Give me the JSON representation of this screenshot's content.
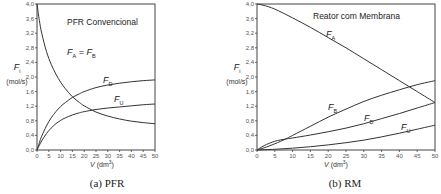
{
  "chart_data": [
    {
      "type": "line",
      "title": "PFR Convencional",
      "caption": "(a) PFR",
      "xlabel": "V (dm³)",
      "xlabel_main": "V",
      "xlabel_unit": "(dm",
      "xlabel_sup": "3",
      "xlabel_close": ")",
      "ylabel": "F_i (mol/s)",
      "ylabel_main": "F",
      "ylabel_sub": "i",
      "ylabel_unit": "(mol/s)",
      "xlim": [
        0,
        50
      ],
      "ylim": [
        0,
        4.0
      ],
      "xticks": [
        "0",
        "5",
        "10",
        "15",
        "20",
        "25",
        "30",
        "35",
        "40",
        "45",
        "50"
      ],
      "yticks": [
        "0,0",
        "0,4",
        "0,8",
        "1,2",
        "1,6",
        "2,0",
        "2,4",
        "2,8",
        "3,2",
        "3,6",
        "4,0"
      ],
      "grid": false,
      "series": [
        {
          "name": "FA = FB",
          "label_main": "F",
          "label_sub": "A",
          "label_eq": " = F",
          "label_sub2": "B",
          "x": [
            0,
            1,
            2,
            4,
            6,
            8,
            10,
            12,
            15,
            18,
            20,
            25,
            30,
            35,
            40,
            45,
            50
          ],
          "y": [
            4.0,
            3.55,
            3.2,
            2.7,
            2.35,
            2.08,
            1.86,
            1.68,
            1.46,
            1.3,
            1.21,
            1.04,
            0.93,
            0.85,
            0.79,
            0.75,
            0.72
          ]
        },
        {
          "name": "FD",
          "label_main": "F",
          "label_sub": "D",
          "x": [
            0,
            1,
            2,
            4,
            6,
            8,
            10,
            12,
            15,
            18,
            20,
            25,
            30,
            35,
            40,
            45,
            50
          ],
          "y": [
            0.0,
            0.2,
            0.38,
            0.66,
            0.88,
            1.05,
            1.19,
            1.3,
            1.44,
            1.54,
            1.6,
            1.71,
            1.78,
            1.83,
            1.87,
            1.9,
            1.92
          ]
        },
        {
          "name": "FU",
          "label_main": "F",
          "label_sub": "U",
          "x": [
            0,
            1,
            2,
            4,
            6,
            8,
            10,
            12,
            15,
            18,
            20,
            25,
            30,
            35,
            40,
            45,
            50
          ],
          "y": [
            0.0,
            0.13,
            0.25,
            0.45,
            0.6,
            0.72,
            0.81,
            0.88,
            0.96,
            1.02,
            1.05,
            1.11,
            1.15,
            1.18,
            1.21,
            1.24,
            1.26
          ]
        }
      ]
    },
    {
      "type": "line",
      "title": "Reator com Membrana",
      "caption": "(b) RM",
      "xlabel": "V (dm³)",
      "xlabel_main": "V",
      "xlabel_unit": "(dm",
      "xlabel_sup": "3",
      "xlabel_close": ")",
      "ylabel": "F_i (mol/s)",
      "ylabel_main": "F",
      "ylabel_sub": "i",
      "ylabel_unit": "(mol/s)",
      "xlim": [
        0,
        50
      ],
      "ylim": [
        0,
        4.0
      ],
      "xticks": [
        "0",
        "5",
        "10",
        "15",
        "20",
        "25",
        "30",
        "35",
        "40",
        "45",
        "50"
      ],
      "yticks": [
        "0,0",
        "0,4",
        "0,8",
        "1,2",
        "1,6",
        "2,0",
        "2,4",
        "2,8",
        "3,2",
        "3,6",
        "4,0"
      ],
      "grid": false,
      "series": [
        {
          "name": "FA",
          "label_main": "F",
          "label_sub": "A",
          "x": [
            0,
            2,
            5,
            10,
            15,
            20,
            25,
            30,
            35,
            40,
            45,
            50
          ],
          "y": [
            4.0,
            3.96,
            3.86,
            3.62,
            3.36,
            3.08,
            2.8,
            2.5,
            2.2,
            1.9,
            1.6,
            1.3
          ]
        },
        {
          "name": "FB",
          "label_main": "F",
          "label_sub": "B",
          "x": [
            0,
            2,
            5,
            8,
            10,
            15,
            20,
            25,
            30,
            35,
            40,
            45,
            50
          ],
          "y": [
            0.0,
            0.06,
            0.17,
            0.3,
            0.4,
            0.65,
            0.9,
            1.12,
            1.33,
            1.5,
            1.65,
            1.79,
            1.9
          ]
        },
        {
          "name": "FD",
          "label_main": "F",
          "label_sub": "D",
          "x": [
            0,
            2,
            5,
            8,
            10,
            15,
            20,
            25,
            30,
            35,
            40,
            45,
            50
          ],
          "y": [
            0.0,
            0.12,
            0.24,
            0.3,
            0.33,
            0.41,
            0.5,
            0.6,
            0.72,
            0.86,
            1.0,
            1.15,
            1.3
          ]
        },
        {
          "name": "FU",
          "label_main": "F",
          "label_sub": "U",
          "x": [
            0,
            5,
            10,
            15,
            20,
            25,
            30,
            35,
            40,
            45,
            50
          ],
          "y": [
            0.0,
            0.02,
            0.05,
            0.09,
            0.14,
            0.2,
            0.27,
            0.36,
            0.46,
            0.57,
            0.68
          ]
        }
      ]
    }
  ]
}
